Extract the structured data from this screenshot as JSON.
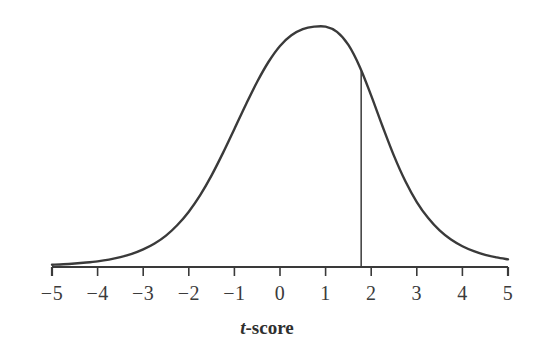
{
  "figure": {
    "background_color": "#ffffff",
    "ink_color": "#3a3a3a",
    "axis_title_html_t": "t",
    "axis_title_rest": "-score",
    "axis_title_full": "t-score"
  },
  "chart_data": {
    "type": "line",
    "title": "",
    "subtitle": "",
    "xlabel": "t-score",
    "ylabel": "",
    "xlim": [
      -5,
      5
    ],
    "ylim": [
      0,
      1
    ],
    "grid": false,
    "legend": null,
    "x_ticks": [
      -5,
      -4,
      -3,
      -2,
      -1,
      0,
      1,
      2,
      3,
      4,
      5
    ],
    "x_tick_labels": [
      "−5",
      "−4",
      "−3",
      "−2",
      "−1",
      "0",
      "1",
      "2",
      "3",
      "4",
      "5"
    ],
    "y_ticks": [],
    "y_tick_labels": [],
    "series": [
      {
        "name": "t-distribution density",
        "x": [
          -5.0,
          -4.75,
          -4.5,
          -4.25,
          -4.0,
          -3.75,
          -3.5,
          -3.25,
          -3.0,
          -2.75,
          -2.5,
          -2.25,
          -2.0,
          -1.75,
          -1.5,
          -1.25,
          -1.0,
          -0.75,
          -0.5,
          -0.25,
          0.0,
          0.25,
          0.5,
          0.75,
          1.0,
          1.25,
          1.5,
          1.75,
          2.0,
          2.25,
          2.5,
          2.75,
          3.0,
          3.25,
          3.5,
          3.75,
          4.0,
          4.25,
          4.5,
          4.75,
          5.0
        ],
        "y": [
          0.009,
          0.011,
          0.014,
          0.018,
          0.023,
          0.03,
          0.04,
          0.053,
          0.071,
          0.095,
          0.127,
          0.17,
          0.224,
          0.291,
          0.371,
          0.462,
          0.559,
          0.657,
          0.75,
          0.831,
          0.895,
          0.938,
          0.963,
          0.973,
          0.973,
          0.952,
          0.899,
          0.81,
          0.694,
          0.569,
          0.45,
          0.347,
          0.263,
          0.198,
          0.148,
          0.111,
          0.084,
          0.064,
          0.049,
          0.039,
          0.031
        ]
      }
    ],
    "annotations": [
      {
        "type": "vertical-line",
        "name": "critical-value-line",
        "x": 1.78,
        "y_from": 0,
        "y_to": 0.793,
        "label": ""
      },
      {
        "type": "region",
        "name": "right-tail-region",
        "x_from": 1.78,
        "x_to": 5.0,
        "fill": "#ffffff",
        "label": ""
      }
    ]
  }
}
